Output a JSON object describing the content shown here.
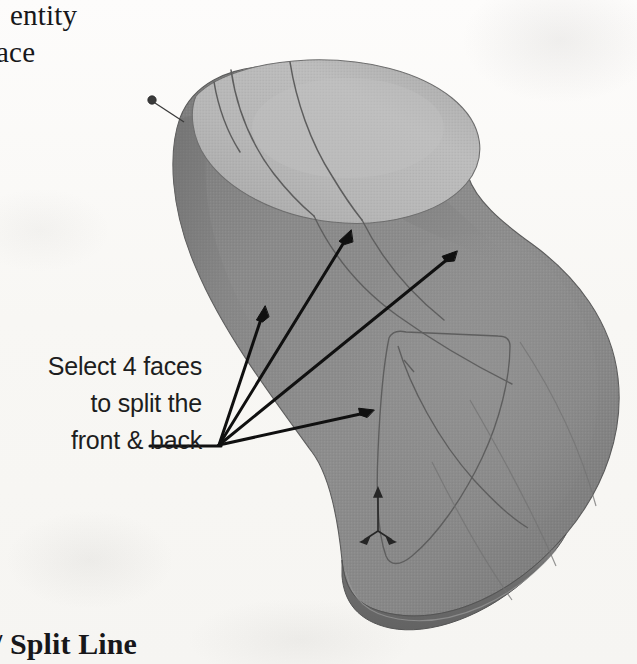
{
  "figure": {
    "kind": "cad-3d-model-figure",
    "background_color": "#f8f7f4",
    "annotations": {
      "top_text_line1": "entity",
      "top_text_line2": "ace",
      "callout_line1": "Select 4 faces",
      "callout_line2": "to split the",
      "callout_line3": "front & back",
      "caption": "/ Split Line"
    },
    "model": {
      "name": "shoe-last-solid",
      "body_fill": "#8b8b8b",
      "body_shadow_fill": "#787878",
      "top_face_fill": "#b3b3b3",
      "top_face_highlight": "#bdbdbd",
      "edge_color": "#4a4a4a",
      "sketch_curve_color": "#636363",
      "bottom_rim_fill": "#6f6f6f",
      "leader_dot_color": "#3a3a3a",
      "triad_color": "#2b2b2b"
    },
    "arrows": {
      "color": "#111111",
      "origin_x": 219,
      "origin_y": 445,
      "count": 4,
      "tips": [
        {
          "name": "arrow-tip-1",
          "x": 265,
          "y": 309
        },
        {
          "name": "arrow-tip-2",
          "x": 351,
          "y": 231
        },
        {
          "name": "arrow-tip-3",
          "x": 456,
          "y": 252
        },
        {
          "name": "arrow-tip-4",
          "x": 373,
          "y": 410
        }
      ],
      "leader_tail_x": 150,
      "leader_tail_y": 447
    },
    "leader_pin": {
      "name": "top-leader-pin",
      "dot_x": 152,
      "dot_y": 100,
      "end_x": 184,
      "end_y": 121
    },
    "origin_triad": {
      "name": "origin-triad",
      "x": 378,
      "y": 492
    }
  }
}
